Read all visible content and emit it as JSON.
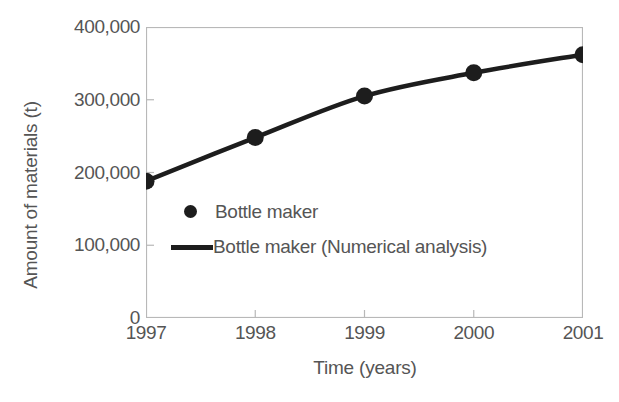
{
  "chart_data": {
    "type": "line",
    "title": "",
    "xlabel": "Time (years)",
    "ylabel": "Amount of materials (t)",
    "categories": [
      "1997",
      "1998",
      "1999",
      "2000",
      "2001"
    ],
    "x": [
      1997,
      1998,
      1999,
      2000,
      2001
    ],
    "xlim": [
      1997,
      2001
    ],
    "ylim": [
      0,
      400000
    ],
    "grid": false,
    "legend_position": "inside-lower-left",
    "yticks": [
      "0",
      "100,000",
      "200,000",
      "300,000",
      "400,000"
    ],
    "ytick_values": [
      0,
      100000,
      200000,
      300000,
      400000
    ],
    "xticks": [
      "1997",
      "1998",
      "1999",
      "2000",
      "2001"
    ],
    "series": [
      {
        "name": "Bottle maker",
        "style": "markers",
        "marker": "circle",
        "color": "#1d1d1d",
        "values": [
          188000,
          248000,
          305000,
          337000,
          362000
        ]
      },
      {
        "name": "Bottle maker (Numerical analysis)",
        "style": "line",
        "color": "#1d1d1d",
        "values": [
          188000,
          248000,
          305000,
          337000,
          362000
        ]
      }
    ]
  },
  "legend": {
    "items": [
      {
        "label": "Bottle maker",
        "marker": "circle-marker"
      },
      {
        "label": "Bottle maker (Numerical analysis)",
        "marker": "line-marker"
      }
    ]
  },
  "caption": "",
  "colors": {
    "data": "#1d1d1d",
    "axis": "#b4b4b4",
    "text": "#555555",
    "background": "#ffffff"
  }
}
